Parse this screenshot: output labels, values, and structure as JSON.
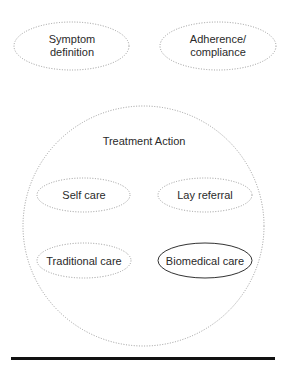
{
  "diagram": {
    "type": "nested-ellipse-concept-map",
    "top_nodes": [
      {
        "id": "symptom",
        "lines": [
          "Symptom",
          "definition"
        ],
        "outline": "dotted"
      },
      {
        "id": "adherence",
        "lines": [
          "Adherence/",
          "compliance"
        ],
        "outline": "dotted"
      }
    ],
    "container": {
      "id": "treatment-action",
      "title": "Treatment Action",
      "outline": "dotted",
      "children": [
        {
          "id": "self-care",
          "label": "Self care",
          "outline": "dotted"
        },
        {
          "id": "lay-referral",
          "label": "Lay referral",
          "outline": "dotted"
        },
        {
          "id": "traditional-care",
          "label": "Traditional care",
          "outline": "dotted"
        },
        {
          "id": "biomedical-care",
          "label": "Biomedical care",
          "outline": "solid"
        }
      ]
    },
    "colors": {
      "dotted_stroke": "#9a9a9a",
      "solid_stroke": "#333333",
      "text": "#2a2a2a",
      "rule": "#111111"
    }
  }
}
